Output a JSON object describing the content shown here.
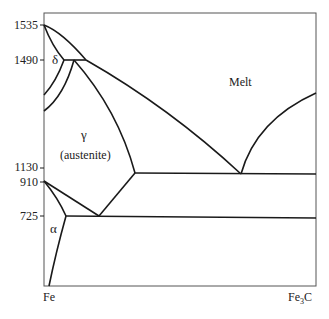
{
  "diagram": {
    "type": "phase-diagram",
    "y_axis_ticks": [
      {
        "label": "1535",
        "y": 25
      },
      {
        "label": "1490",
        "y": 60
      },
      {
        "label": "1130",
        "y": 168
      },
      {
        "label": "910",
        "y": 182
      },
      {
        "label": "725",
        "y": 216
      }
    ],
    "x_axis_labels": {
      "left": "Fe",
      "right": "Fe",
      "right_sub": "3",
      "right_suffix": "C"
    },
    "regions": {
      "delta": "δ",
      "gamma": "γ",
      "austenite": "(austenite)",
      "alpha": "α",
      "melt": "Melt"
    },
    "line_color": "#1a1a1a"
  }
}
